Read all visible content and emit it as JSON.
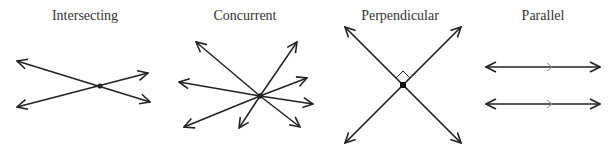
{
  "diagrams": [
    {
      "key": "intersecting",
      "title": "Intersecting"
    },
    {
      "key": "concurrent",
      "title": "Concurrent"
    },
    {
      "key": "perpendicular",
      "title": "Perpendicular"
    },
    {
      "key": "parallel",
      "title": "Parallel"
    }
  ],
  "style": {
    "stroke": "#222222"
  }
}
